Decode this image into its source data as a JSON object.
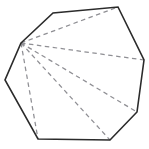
{
  "figure": {
    "kind": "geometry-diagram",
    "shape_name": "octagon",
    "canvas": {
      "width": 149,
      "height": 149,
      "background": "#ffffff"
    },
    "style": {
      "outline_color": "#2b2b2b",
      "outline_width": 1.6,
      "diagonal_color": "#8f8f94",
      "diagonal_width": 1.25,
      "diagonal_dash": "4.5 3.5"
    },
    "vertex_count": 8,
    "side_count": 8,
    "diagonal_count_from_apex": 5,
    "triangle_count": 6,
    "apex_index": 0,
    "vertices": [
      {
        "label": "A",
        "x": 21,
        "y": 43
      },
      {
        "label": "B",
        "x": 53,
        "y": 13
      },
      {
        "label": "C",
        "x": 118,
        "y": 7
      },
      {
        "label": "D",
        "x": 144,
        "y": 60
      },
      {
        "label": "E",
        "x": 137,
        "y": 112
      },
      {
        "label": "F",
        "x": 110,
        "y": 140
      },
      {
        "label": "G",
        "x": 38,
        "y": 139
      },
      {
        "label": "H",
        "x": 5,
        "y": 80
      }
    ],
    "diagonals": [
      {
        "from": 0,
        "to": 2
      },
      {
        "from": 0,
        "to": 3
      },
      {
        "from": 0,
        "to": 4
      },
      {
        "from": 0,
        "to": 5
      },
      {
        "from": 0,
        "to": 6
      }
    ]
  }
}
